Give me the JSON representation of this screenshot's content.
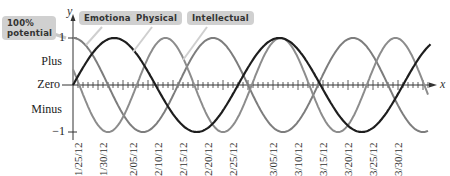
{
  "chart_data": {
    "type": "line",
    "title": "",
    "xlabel": "x",
    "ylabel": "y",
    "ylim": [
      -1,
      1
    ],
    "y_ticks": [
      {
        "value": 1,
        "label": "1"
      },
      {
        "value": 0,
        "label": "Zero"
      },
      {
        "value": -1,
        "label": "−1"
      }
    ],
    "y_region_labels": {
      "plus": "Plus",
      "minus": "Minus"
    },
    "x_tick_labels": [
      "1/25/12",
      "1/30/12",
      "2/05/12",
      "2/10/12",
      "2/15/12",
      "2/20/12",
      "2/25/12",
      "3/05/12",
      "3/10/12",
      "3/15/12",
      "3/20/12",
      "3/25/12",
      "3/30/12"
    ],
    "x_range_days": [
      0,
      70
    ],
    "legend_position": "top callouts",
    "annotations": [
      "100% potential"
    ],
    "series": [
      {
        "name": "Emotional",
        "period_days": 28,
        "phase": "starts at peak (1) on 1/25/12",
        "color": "#7a7a7a",
        "x_days": [
          0,
          7,
          14,
          21,
          28,
          35,
          42,
          49,
          56,
          63,
          70
        ],
        "values": [
          1,
          0,
          -1,
          0,
          1,
          0,
          -1,
          0,
          1,
          0,
          -1
        ]
      },
      {
        "name": "Physical",
        "period_days": 23,
        "phase": "peaks near 2/12/12",
        "color": "#8a8a8a",
        "x_days": [
          0,
          6,
          12,
          17,
          23,
          29,
          35,
          40,
          46,
          52,
          58,
          63,
          69
        ],
        "values": [
          -0.9,
          -0.2,
          0.9,
          0.4,
          -0.9,
          -0.2,
          0.9,
          0.4,
          -0.9,
          -0.2,
          0.9,
          0.4,
          -0.9
        ]
      },
      {
        "name": "Intellectual",
        "period_days": 33,
        "phase": "starts at zero rising on 1/25/12",
        "color": "#222222",
        "x_days": [
          0,
          8,
          16,
          25,
          33,
          41,
          49,
          58,
          66,
          70
        ],
        "values": [
          0,
          1,
          0,
          -1,
          0,
          1,
          0,
          -1,
          0,
          0.5
        ]
      }
    ]
  },
  "labels": {
    "potential": "100% potential",
    "emotional": "Emotional",
    "physical": "Physical",
    "intellectual": "Intellectual",
    "y_axis": "y",
    "x_axis": "x",
    "one": "1",
    "plus": "Plus",
    "zero": "Zero",
    "minus": "Minus",
    "neg_one": "−1"
  },
  "dates": [
    "1/25/12",
    "1/30/12",
    "2/05/12",
    "2/10/12",
    "2/15/12",
    "2/20/12",
    "2/25/12",
    "3/05/12",
    "3/10/12",
    "3/15/12",
    "3/20/12",
    "3/25/12",
    "3/30/12"
  ]
}
